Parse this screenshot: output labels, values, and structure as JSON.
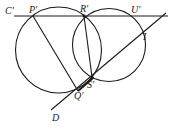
{
  "figure": {
    "labels": {
      "C": "C′",
      "P": "P′",
      "R": "R′",
      "U": "U′",
      "I": "I",
      "S": "S′",
      "Q": "Q′",
      "D": "D"
    },
    "elements": {
      "line_CU": "Line C′U′ through P′, R′, U′",
      "line_D": "Line through D, Q′, S′, I",
      "segment_PQ": "P′Q′",
      "segment_RS": "R′S′",
      "circle_left": "Circle through P′, R′, Q′",
      "circle_right": "Circle through R′, U′, I, S′"
    },
    "color": "#1a1a1a"
  }
}
